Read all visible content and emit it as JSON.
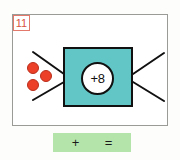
{
  "problem": {
    "number": "11",
    "badge_color": "#d9543f",
    "badge_border": "#e2796a"
  },
  "machine": {
    "rule_label": "+8",
    "box_color": "#62c6c6",
    "border_color": "#111111",
    "circle_fill": "#ffffff"
  },
  "input": {
    "counter_color": "#ec4028",
    "counter_count": 3,
    "counters": [
      {
        "name": "counter-1"
      },
      {
        "name": "counter-2"
      },
      {
        "name": "counter-3"
      }
    ]
  },
  "answer_bar": {
    "background": "#b5e4ab",
    "plus_symbol": "+",
    "equals_symbol": "="
  },
  "frame": {
    "border_color": "#9a9a96",
    "background": "#ffffff"
  }
}
